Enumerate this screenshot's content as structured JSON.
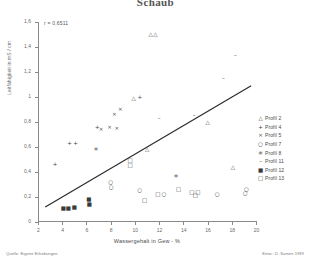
{
  "title": "Schaub",
  "annotation": "r = 0,6511",
  "footer": {
    "left": "Quelle: Eigene Erhebungen",
    "right": "Entw.: D. Samen 1989"
  },
  "legend": {
    "entries": [
      {
        "marker": "triangle-up-open",
        "glyph": "△",
        "label": "Profil 2"
      },
      {
        "marker": "plus",
        "glyph": "+",
        "label": "Profil 4"
      },
      {
        "marker": "cross-x",
        "glyph": "×",
        "label": "Profil 5"
      },
      {
        "marker": "circle-open",
        "glyph": "○",
        "label": "Profil 7"
      },
      {
        "marker": "asterisk",
        "glyph": "✳",
        "label": "Profil 8"
      },
      {
        "marker": "dash",
        "glyph": "–",
        "label": "Profil 11"
      },
      {
        "marker": "square-filled",
        "glyph": "■",
        "label": "Profil 12"
      },
      {
        "marker": "square-open",
        "glyph": "□",
        "label": "Profil 13"
      }
    ]
  },
  "chart_data": {
    "type": "scatter",
    "title": "Schaub",
    "xlabel": "Wassergehalt in Gew - %",
    "ylabel": "Leitfähigkeit in mS / cm",
    "xlim": [
      2,
      20
    ],
    "ylim": [
      0,
      1.6
    ],
    "xticks": [
      2,
      4,
      6,
      8,
      10,
      12,
      14,
      16,
      18,
      20
    ],
    "xtick_labels": [
      "2",
      "4",
      "6",
      "8",
      "10",
      "12",
      "14",
      "16",
      "18",
      "20"
    ],
    "yticks": [
      0,
      0.2,
      0.4,
      0.6,
      0.8,
      1,
      1.2,
      1.4,
      1.6
    ],
    "ytick_labels": [
      "0",
      "0,2",
      "0,4",
      "0,6",
      "0,8",
      "1",
      "1,2",
      "1,4",
      "1,6"
    ],
    "grid": false,
    "legend_position": "right",
    "annotations": [
      {
        "text": "r = 0,6511",
        "x": 3.2,
        "y": 1.52
      }
    ],
    "trendline": {
      "x": [
        2.6,
        19.6
      ],
      "y": [
        0.12,
        1.09
      ],
      "r": 0.6511
    },
    "series": [
      {
        "name": "Profil 2",
        "marker": "triangle-up-open",
        "points": [
          {
            "x": 11.3,
            "y": 1.495
          },
          {
            "x": 11.7,
            "y": 1.495
          },
          {
            "x": 9.9,
            "y": 0.985
          },
          {
            "x": 16.0,
            "y": 0.79
          },
          {
            "x": 11.0,
            "y": 0.575
          },
          {
            "x": 18.1,
            "y": 0.43
          }
        ]
      },
      {
        "name": "Profil 4",
        "marker": "plus",
        "points": [
          {
            "x": 10.4,
            "y": 0.99
          },
          {
            "x": 6.9,
            "y": 0.755
          },
          {
            "x": 4.6,
            "y": 0.625
          },
          {
            "x": 5.1,
            "y": 0.625
          },
          {
            "x": 3.4,
            "y": 0.46
          }
        ]
      },
      {
        "name": "Profil 5",
        "marker": "cross-x",
        "points": [
          {
            "x": 8.3,
            "y": 0.855
          },
          {
            "x": 8.8,
            "y": 0.895
          },
          {
            "x": 8.5,
            "y": 0.745
          },
          {
            "x": 7.9,
            "y": 0.755
          },
          {
            "x": 7.2,
            "y": 0.735
          }
        ]
      },
      {
        "name": "Profil 7",
        "marker": "circle-open",
        "points": [
          {
            "x": 8.0,
            "y": 0.315
          },
          {
            "x": 8.05,
            "y": 0.275
          },
          {
            "x": 10.4,
            "y": 0.245
          },
          {
            "x": 12.4,
            "y": 0.22
          },
          {
            "x": 16.8,
            "y": 0.22
          },
          {
            "x": 19.1,
            "y": 0.225
          },
          {
            "x": 19.2,
            "y": 0.255
          }
        ]
      },
      {
        "name": "Profil 8",
        "marker": "asterisk",
        "points": [
          {
            "x": 6.8,
            "y": 0.575
          },
          {
            "x": 13.4,
            "y": 0.36
          }
        ]
      },
      {
        "name": "Profil 11",
        "marker": "dash",
        "points": [
          {
            "x": 18.3,
            "y": 1.325
          },
          {
            "x": 17.3,
            "y": 1.145
          },
          {
            "x": 14.9,
            "y": 0.845
          },
          {
            "x": 12.0,
            "y": 0.825
          }
        ]
      },
      {
        "name": "Profil 12",
        "marker": "square-filled",
        "points": [
          {
            "x": 4.1,
            "y": 0.105
          },
          {
            "x": 4.5,
            "y": 0.105
          },
          {
            "x": 5.0,
            "y": 0.11
          },
          {
            "x": 6.2,
            "y": 0.175
          },
          {
            "x": 6.25,
            "y": 0.135
          }
        ]
      },
      {
        "name": "Profil 13",
        "marker": "square-open",
        "points": [
          {
            "x": 9.6,
            "y": 0.485
          },
          {
            "x": 9.6,
            "y": 0.445
          },
          {
            "x": 13.6,
            "y": 0.26
          },
          {
            "x": 14.7,
            "y": 0.235
          },
          {
            "x": 15.2,
            "y": 0.235
          },
          {
            "x": 15.0,
            "y": 0.205
          },
          {
            "x": 11.9,
            "y": 0.215
          },
          {
            "x": 10.8,
            "y": 0.165
          }
        ]
      }
    ]
  }
}
